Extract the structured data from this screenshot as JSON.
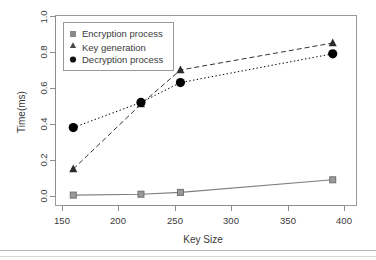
{
  "chart_data": {
    "type": "line",
    "title": "",
    "xlabel": "Key Size",
    "ylabel": "Time(ms)",
    "xlim": [
      143,
      403
    ],
    "ylim": [
      -0.035,
      1.035
    ],
    "xticks": [
      150,
      200,
      250,
      300,
      350,
      400
    ],
    "xtick_labels": [
      "150",
      "200",
      "250",
      "300",
      "350",
      "400"
    ],
    "yticks": [
      0.0,
      0.2,
      0.4,
      0.6,
      0.8,
      1.0
    ],
    "ytick_labels": [
      "0.0",
      "0.2",
      "0.4",
      "0.6",
      "0.8",
      "1.0"
    ],
    "grid": false,
    "legend_position": "top-left",
    "x": [
      160,
      220,
      255,
      390
    ],
    "series": [
      {
        "name": "Encryption process",
        "marker": "square",
        "linestyle": "solid",
        "color": "#7f7f7f",
        "values": [
          0.005,
          0.01,
          0.02,
          0.09
        ]
      },
      {
        "name": "Key generation",
        "marker": "triangle",
        "linestyle": "dashed",
        "color": "#333333",
        "values": [
          0.15,
          0.51,
          0.7,
          0.85
        ]
      },
      {
        "name": "Decryption process",
        "marker": "circle",
        "linestyle": "dotted",
        "color": "#000000",
        "values": [
          0.38,
          0.52,
          0.63,
          0.79
        ]
      }
    ]
  },
  "legend": {
    "items": [
      {
        "label": "Encryption process",
        "marker": "square",
        "color": "#8a8a8a"
      },
      {
        "label": "Key generation",
        "marker": "triangle",
        "color": "#4a4a4a"
      },
      {
        "label": "Decryption process",
        "marker": "circle",
        "color": "#111111"
      }
    ]
  },
  "axes": {
    "x_title": "Key Size",
    "y_title": "Time(ms)"
  }
}
